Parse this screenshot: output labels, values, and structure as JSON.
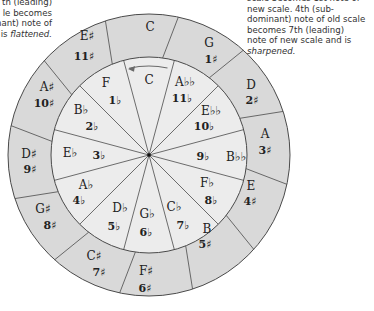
{
  "annotations": {
    "left": {
      "lines": [
        "th (leading)",
        "le becomes",
        "nant) note of"
      ],
      "last_prefix": "is ",
      "last_emphasis": "flattened."
    },
    "right": {
      "lines": [
        "scale becomes 1st note of",
        "new scale. 4th (sub-",
        "dominant) note of old scale",
        "becomes 7th (leading)",
        "note of new scale and is"
      ],
      "last_emphasis": "sharpened."
    }
  },
  "colors": {
    "outer_ring": "#d9d9d9",
    "inner_ring": "#ececec",
    "stroke": "#4a4a4a",
    "text": "#222222",
    "arrow": "#6a6a6a"
  },
  "circle": {
    "center": [
      149,
      155
    ],
    "outer_radius": 141,
    "inner_radius": 98,
    "arrow_direction": "counter-clockwise"
  },
  "outer_ring": [
    {
      "key": "C",
      "count": "",
      "kx": 150,
      "ky": 27,
      "nx": 150,
      "ny": 27
    },
    {
      "key": "G",
      "count": "1♯",
      "kx": 209,
      "ky": 43,
      "nx": 211,
      "ny": 60
    },
    {
      "key": "D",
      "count": "2♯",
      "kx": 251,
      "ky": 85,
      "nx": 252,
      "ny": 101
    },
    {
      "key": "A",
      "count": "3♯",
      "kx": 265,
      "ky": 134,
      "nx": 265,
      "ny": 151
    },
    {
      "key": "E",
      "count": "4♯",
      "kx": 251,
      "ky": 186,
      "nx": 250,
      "ny": 202
    },
    {
      "key": "B",
      "count": "5♯",
      "kx": 207,
      "ky": 229,
      "nx": 205,
      "ny": 245
    },
    {
      "key": "F♯",
      "count": "6♯",
      "kx": 146,
      "ky": 271,
      "nx": 145,
      "ny": 289
    },
    {
      "key": "C♯",
      "count": "7♯",
      "kx": 94,
      "ky": 256,
      "nx": 99,
      "ny": 273
    },
    {
      "key": "G♯",
      "count": "8♯",
      "kx": 43,
      "ky": 209,
      "nx": 50,
      "ny": 226
    },
    {
      "key": "D♯",
      "count": "9♯",
      "kx": 29,
      "ky": 154,
      "nx": 30,
      "ny": 170
    },
    {
      "key": "A♯",
      "count": "10♯",
      "kx": 47,
      "ky": 87,
      "nx": 44,
      "ny": 104
    },
    {
      "key": "E♯",
      "count": "11♯",
      "kx": 87,
      "ky": 36,
      "nx": 84,
      "ny": 57
    }
  ],
  "inner_ring": [
    {
      "key": "C",
      "count": "",
      "kx": 149,
      "ky": 80,
      "nx": 149,
      "ny": 80
    },
    {
      "key": "A♭♭",
      "count": "11♭",
      "kx": 185,
      "ky": 82,
      "nx": 182,
      "ny": 99
    },
    {
      "key": "E♭♭",
      "count": "10♭",
      "kx": 211,
      "ky": 111,
      "nx": 204,
      "ny": 127
    },
    {
      "key": "B♭♭",
      "count": "9♭",
      "kx": 236,
      "ky": 157,
      "nx": 203,
      "ny": 157
    },
    {
      "key": "F♭",
      "count": "8♭",
      "kx": 207,
      "ky": 183,
      "nx": 211,
      "ny": 201
    },
    {
      "key": "C♭",
      "count": "7♭",
      "kx": 174,
      "ky": 207,
      "nx": 183,
      "ny": 226
    },
    {
      "key": "G♭",
      "count": "6♭",
      "kx": 147,
      "ky": 214,
      "nx": 146,
      "ny": 233
    },
    {
      "key": "D♭",
      "count": "5♭",
      "kx": 120,
      "ky": 208,
      "nx": 114,
      "ny": 227
    },
    {
      "key": "A♭",
      "count": "4♭",
      "kx": 86,
      "ky": 185,
      "nx": 79,
      "ny": 201
    },
    {
      "key": "E♭",
      "count": "3♭",
      "kx": 70,
      "ky": 153,
      "nx": 99,
      "ny": 156
    },
    {
      "key": "B♭",
      "count": "2♭",
      "kx": 81,
      "ky": 110,
      "nx": 92,
      "ny": 127
    },
    {
      "key": "F",
      "count": "1♭",
      "kx": 106,
      "ky": 83,
      "nx": 115,
      "ny": 101
    }
  ]
}
